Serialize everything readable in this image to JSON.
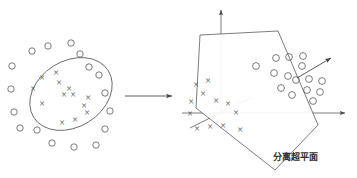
{
  "figure": {
    "title_strip": "·· ·· ··· ··",
    "background_color": "#ffffff",
    "stroke_color": "#5a5a5a"
  },
  "left_panel": {
    "name": "input-space",
    "ellipse": {
      "cx": 71,
      "cy": 94,
      "rx": 44,
      "ry": 33,
      "rotation_deg": -32
    },
    "cross_label": "×",
    "crosses": [
      {
        "x": 42,
        "y": 77
      },
      {
        "x": 56,
        "y": 72
      },
      {
        "x": 33,
        "y": 88
      },
      {
        "x": 59,
        "y": 82
      },
      {
        "x": 69,
        "y": 88
      },
      {
        "x": 42,
        "y": 103
      },
      {
        "x": 64,
        "y": 94
      },
      {
        "x": 73,
        "y": 94
      },
      {
        "x": 88,
        "y": 97
      },
      {
        "x": 84,
        "y": 105
      },
      {
        "x": 87,
        "y": 112
      },
      {
        "x": 62,
        "y": 122
      },
      {
        "x": 75,
        "y": 119
      }
    ],
    "circles": [
      {
        "x": 32,
        "y": 51
      },
      {
        "x": 48,
        "y": 46
      },
      {
        "x": 71,
        "y": 43
      },
      {
        "x": 12,
        "y": 66
      },
      {
        "x": 80,
        "y": 54
      },
      {
        "x": 11,
        "y": 89
      },
      {
        "x": 89,
        "y": 67
      },
      {
        "x": 99,
        "y": 75
      },
      {
        "x": 14,
        "y": 112
      },
      {
        "x": 105,
        "y": 93
      },
      {
        "x": 20,
        "y": 128
      },
      {
        "x": 110,
        "y": 111
      },
      {
        "x": 37,
        "y": 130
      },
      {
        "x": 105,
        "y": 129
      },
      {
        "x": 52,
        "y": 143
      },
      {
        "x": 74,
        "y": 147
      },
      {
        "x": 96,
        "y": 145
      }
    ],
    "circle_radius": 3.2
  },
  "transform_arrow": {
    "name": "mapping-arrow",
    "x1": 125,
    "y1": 96,
    "x2": 172,
    "y2": 96
  },
  "right_panel": {
    "name": "feature-space",
    "axes": {
      "vertical": {
        "x1": 221,
        "y1": 113,
        "x2": 221,
        "y2": 10
      },
      "horizontal": {
        "x1": 182,
        "y1": 113,
        "x2": 345,
        "y2": 113
      },
      "depth": {
        "x1": 190,
        "y1": 128,
        "x2": 252,
        "y2": 97
      }
    },
    "hyperplane": {
      "points": "200,35 278,31 318,125 275,170 196,108",
      "fill": "#ffffff"
    },
    "normal_vector": {
      "x1": 297,
      "y1": 78,
      "x2": 331,
      "y2": 58
    },
    "cross_label": "×",
    "crosses": [
      {
        "x": 196,
        "y": 84
      },
      {
        "x": 208,
        "y": 80
      },
      {
        "x": 203,
        "y": 93
      },
      {
        "x": 191,
        "y": 101
      },
      {
        "x": 216,
        "y": 100
      },
      {
        "x": 228,
        "y": 103
      },
      {
        "x": 190,
        "y": 113
      },
      {
        "x": 236,
        "y": 112
      },
      {
        "x": 197,
        "y": 128
      },
      {
        "x": 210,
        "y": 126
      },
      {
        "x": 223,
        "y": 125
      },
      {
        "x": 240,
        "y": 129
      }
    ],
    "circles": [
      {
        "x": 256,
        "y": 66
      },
      {
        "x": 276,
        "y": 58
      },
      {
        "x": 289,
        "y": 57
      },
      {
        "x": 303,
        "y": 56
      },
      {
        "x": 274,
        "y": 73
      },
      {
        "x": 288,
        "y": 76
      },
      {
        "x": 302,
        "y": 66
      },
      {
        "x": 281,
        "y": 88
      },
      {
        "x": 296,
        "y": 80
      },
      {
        "x": 309,
        "y": 79
      },
      {
        "x": 322,
        "y": 81
      },
      {
        "x": 307,
        "y": 90
      },
      {
        "x": 320,
        "y": 92
      },
      {
        "x": 292,
        "y": 95
      },
      {
        "x": 313,
        "y": 101
      }
    ],
    "circle_radius": 3.4,
    "label": {
      "text": "分离超平面",
      "x": 295,
      "y": 160
    }
  }
}
